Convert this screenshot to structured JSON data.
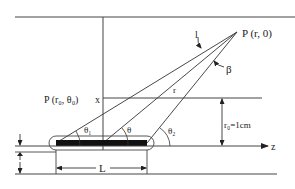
{
  "diagram": {
    "type": "line-source geometry",
    "labels": {
      "point_p": "P (r, 0)",
      "point_p0": "P (r₀, θ₀)",
      "x_axis": "x",
      "z_axis": "z",
      "length": "L",
      "distance": "r",
      "r0": "r₀=1cm",
      "theta1": "θ₁",
      "theta": "θ",
      "theta2": "θ₂",
      "beta": "β",
      "l": "l"
    },
    "colors": {
      "line": "#333333",
      "source": "#111111",
      "background": "#ffffff"
    }
  }
}
